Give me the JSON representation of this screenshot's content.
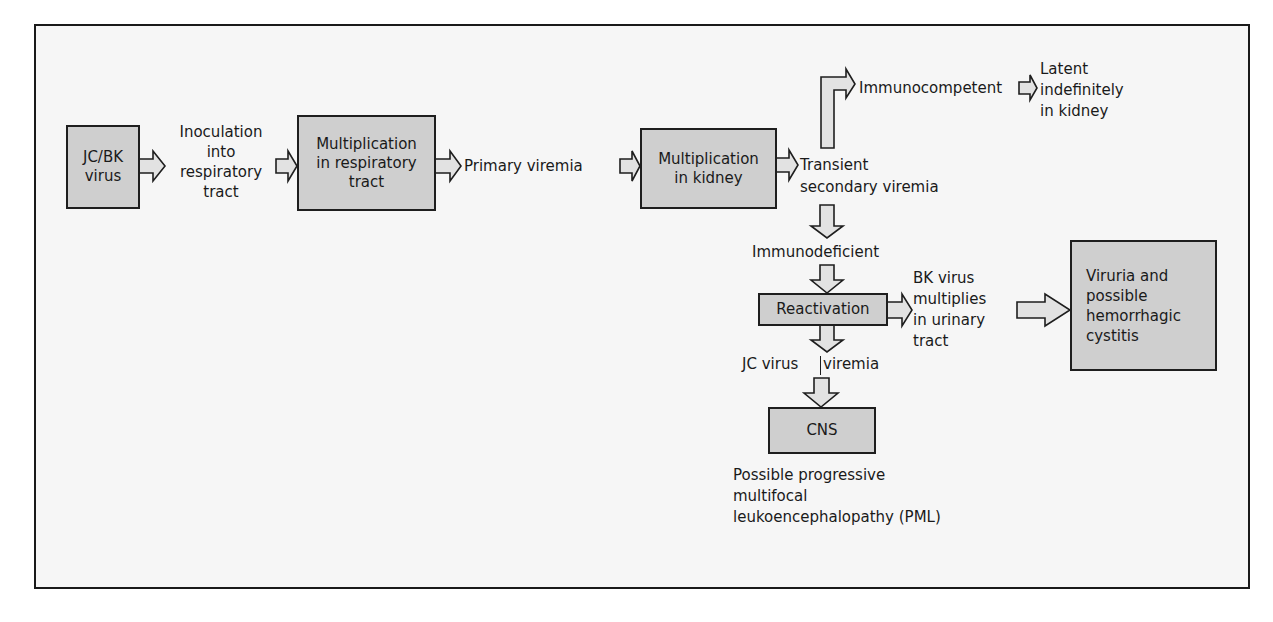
{
  "diagram": {
    "type": "flowchart",
    "nodes": {
      "jcbk_virus": "JC/BK\nvirus",
      "multiplication_respiratory": "Multiplication\nin respiratory\ntract",
      "multiplication_kidney": "Multiplication\nin kidney",
      "reactivation": "Reactivation",
      "cns": "CNS",
      "viruria": "Viruria and\npossible\nhemorrhagic\ncystitis"
    },
    "labels": {
      "inoculation": "Inoculation\ninto\nrespiratory\ntract",
      "primary_viremia": "Primary viremia",
      "transient_secondary_viremia": "Transient\nsecondary viremia",
      "immunocompetent": "Immunocompetent",
      "latent_in_kidney": "Latent\nindefinitely\nin kidney",
      "immunodeficient": "Immunodeficient",
      "bk_virus_multiplies": "BK virus\nmultiplies\nin urinary\ntract",
      "jc_virus": "JC virus",
      "viremia": "viremia",
      "pml": "Possible progressive\nmultifocal\nleukoencephalopathy (PML)"
    },
    "edges": [
      [
        "JC/BK virus",
        "Inoculation into respiratory tract"
      ],
      [
        "Inoculation into respiratory tract",
        "Multiplication in respiratory tract"
      ],
      [
        "Multiplication in respiratory tract",
        "Primary viremia"
      ],
      [
        "Primary viremia",
        "Multiplication in kidney"
      ],
      [
        "Multiplication in kidney",
        "Transient secondary viremia"
      ],
      [
        "Transient secondary viremia",
        "Immunocompetent"
      ],
      [
        "Immunocompetent",
        "Latent indefinitely in kidney"
      ],
      [
        "Transient secondary viremia",
        "Immunodeficient"
      ],
      [
        "Immunodeficient",
        "Reactivation"
      ],
      [
        "Reactivation",
        "BK virus multiplies in urinary tract"
      ],
      [
        "BK virus multiplies in urinary tract",
        "Viruria and possible hemorrhagic cystitis"
      ],
      [
        "Reactivation",
        "JC virus viremia"
      ],
      [
        "JC virus viremia",
        "CNS"
      ]
    ],
    "colors": {
      "box_fill": "#cfcfcf",
      "arrow_fill": "#e2e2e2",
      "stroke": "#1e1e1e",
      "background": "#f6f6f6"
    }
  }
}
